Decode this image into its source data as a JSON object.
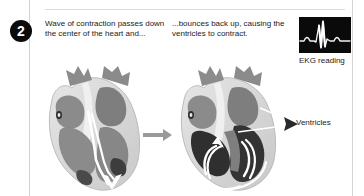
{
  "step": {
    "number": "2"
  },
  "captions": {
    "left": "Wave of contraction passes down the center of the heart and...",
    "right": "...bounces back up, causing the ventricles to contract."
  },
  "ekg": {
    "label": "EKG reading",
    "background_color": "#0a0a0a",
    "trace_color": "#f2f2f2"
  },
  "callout": {
    "ventricles_label": "Ventricles"
  },
  "figures": {
    "left_heart": "heart-cross-section-relaxed",
    "right_heart": "heart-cross-section-contracted",
    "flow_arrow": "right-arrow"
  },
  "colors": {
    "page_background": "#ffffff",
    "rule": "#d4d4d4",
    "text": "#1a1a1a",
    "badge_background": "#0b0b0b",
    "badge_text": "#ffffff",
    "heart_outer_wall": "#d9d9d9",
    "heart_chamber": "#8b8b8b",
    "heart_chamber_dark": "#6e6e6e",
    "heart_contracted": "#3a3a3a",
    "heart_highlight": "#f4f4f4",
    "arrow_gray": "#9a9a9a"
  }
}
